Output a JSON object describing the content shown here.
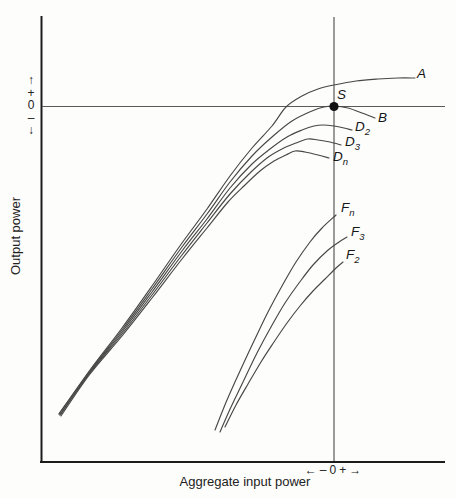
{
  "figure": {
    "background": "#fdfdfc",
    "curve_color": "#474747",
    "axis_color": "#1c1c1c",
    "reference_line_color": "#5a5a5a"
  },
  "axes": {
    "x_title": "Aggregate input power",
    "y_title": "Output power",
    "x_zero_marker": {
      "left_arrow": "←",
      "minus": "–",
      "zero": "0",
      "plus": "+",
      "right_arrow": "→"
    },
    "y_zero_marker": {
      "up_arrow": "↑",
      "plus": "+",
      "zero": "0",
      "minus": "–",
      "down_arrow": "↓"
    }
  },
  "labels": {
    "A": {
      "base": "A",
      "sub": ""
    },
    "S": {
      "base": "S",
      "sub": ""
    },
    "B": {
      "base": "B",
      "sub": ""
    },
    "D2": {
      "base": "D",
      "sub": "2"
    },
    "D3": {
      "base": "D",
      "sub": "3"
    },
    "Dn": {
      "base": "D",
      "sub": "n"
    },
    "Fn": {
      "base": "F",
      "sub": "n"
    },
    "F3": {
      "base": "F",
      "sub": "3"
    },
    "F2": {
      "base": "F",
      "sub": "2"
    }
  },
  "chart_data": {
    "type": "line",
    "title": "",
    "xlabel": "Aggregate input power",
    "ylabel": "Output power",
    "grid": false,
    "legend_position": "curve-end labels",
    "axis_scale_note": "Qualitative axes; only zero-deviation markers '← – 0 + →' are shown, centered on the two reference lines",
    "reference_lines": {
      "vertical_at_x_px": 334,
      "horizontal_at_y_px": 106.5
    },
    "saturation_point": {
      "label": "S",
      "x_px": 334,
      "y_px": 106.5
    },
    "series": [
      {
        "name": "A",
        "points_px": [
          [
            59,
            414
          ],
          [
            90,
            370
          ],
          [
            122,
            328
          ],
          [
            152,
            286
          ],
          [
            182,
            243
          ],
          [
            207,
            209
          ],
          [
            230,
            176
          ],
          [
            252,
            148
          ],
          [
            272,
            126
          ],
          [
            286,
            107
          ],
          [
            302,
            96
          ],
          [
            318,
            89
          ],
          [
            334,
            85
          ],
          [
            356,
            81
          ],
          [
            378,
            79
          ],
          [
            398,
            78
          ],
          [
            415,
            78
          ]
        ]
      },
      {
        "name": "B",
        "points_px": [
          [
            59,
            414
          ],
          [
            90,
            371
          ],
          [
            122,
            330
          ],
          [
            152,
            289
          ],
          [
            182,
            247
          ],
          [
            207,
            214
          ],
          [
            230,
            182
          ],
          [
            252,
            156
          ],
          [
            272,
            137
          ],
          [
            292,
            121
          ],
          [
            312,
            111
          ],
          [
            324,
            107
          ],
          [
            334,
            106
          ],
          [
            348,
            108
          ],
          [
            362,
            113
          ],
          [
            375,
            118
          ]
        ]
      },
      {
        "name": "D2",
        "points_px": [
          [
            60,
            415
          ],
          [
            90,
            372
          ],
          [
            122,
            332
          ],
          [
            152,
            292
          ],
          [
            182,
            251
          ],
          [
            207,
            219
          ],
          [
            230,
            188
          ],
          [
            252,
            164
          ],
          [
            270,
            149
          ],
          [
            287,
            137
          ],
          [
            302,
            130
          ],
          [
            314,
            126
          ],
          [
            323,
            125
          ],
          [
            334,
            126
          ],
          [
            344,
            128
          ],
          [
            352,
            130
          ]
        ]
      },
      {
        "name": "D3",
        "points_px": [
          [
            60,
            415
          ],
          [
            90,
            373
          ],
          [
            122,
            334
          ],
          [
            152,
            295
          ],
          [
            182,
            255
          ],
          [
            207,
            223
          ],
          [
            230,
            194
          ],
          [
            250,
            173
          ],
          [
            267,
            158
          ],
          [
            282,
            149
          ],
          [
            296,
            143
          ],
          [
            308,
            139
          ],
          [
            318,
            140
          ],
          [
            330,
            142
          ],
          [
            341,
            145
          ]
        ]
      },
      {
        "name": "Dn",
        "points_px": [
          [
            61,
            416
          ],
          [
            90,
            374
          ],
          [
            122,
            336
          ],
          [
            152,
            298
          ],
          [
            182,
            259
          ],
          [
            207,
            228
          ],
          [
            228,
            202
          ],
          [
            245,
            185
          ],
          [
            260,
            171
          ],
          [
            274,
            161
          ],
          [
            286,
            155
          ],
          [
            295,
            151
          ],
          [
            305,
            152
          ],
          [
            318,
            155
          ],
          [
            329,
            158
          ]
        ]
      },
      {
        "name": "Fn",
        "points_px": [
          [
            215,
            430
          ],
          [
            227,
            400
          ],
          [
            240,
            371
          ],
          [
            254,
            341
          ],
          [
            268,
            312
          ],
          [
            282,
            286
          ],
          [
            296,
            262
          ],
          [
            310,
            242
          ],
          [
            322,
            228
          ],
          [
            336,
            215
          ]
        ]
      },
      {
        "name": "F3",
        "points_px": [
          [
            220,
            432
          ],
          [
            231,
            407
          ],
          [
            243,
            382
          ],
          [
            257,
            353
          ],
          [
            271,
            327
          ],
          [
            285,
            303
          ],
          [
            299,
            283
          ],
          [
            313,
            265
          ],
          [
            327,
            251
          ],
          [
            339,
            242
          ],
          [
            347,
            237
          ]
        ]
      },
      {
        "name": "F2",
        "points_px": [
          [
            225,
            427
          ],
          [
            236,
            405
          ],
          [
            248,
            384
          ],
          [
            261,
            362
          ],
          [
            274,
            342
          ],
          [
            287,
            323
          ],
          [
            300,
            306
          ],
          [
            313,
            291
          ],
          [
            325,
            279
          ],
          [
            336,
            268
          ],
          [
            343,
            262
          ]
        ]
      }
    ]
  }
}
